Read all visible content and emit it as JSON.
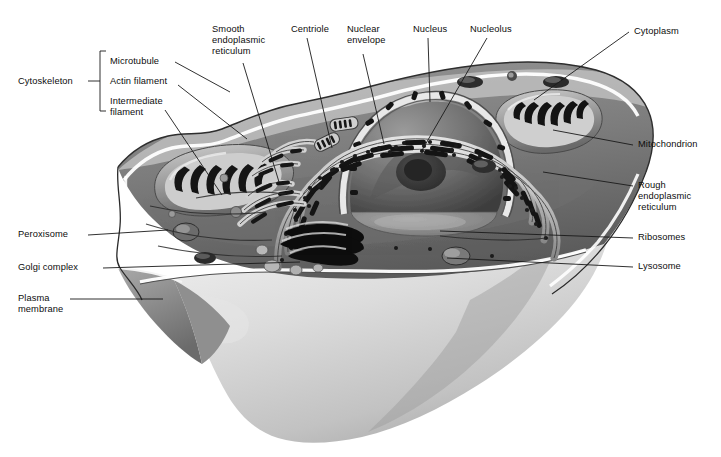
{
  "figure": {
    "style": "grayscale airbrush biological illustration",
    "colors": {
      "background": "#ffffff",
      "label_text": "#0d0d0d",
      "leader_line": "#1a1a1a",
      "cytoplasm_mid": "#8e8e8e",
      "cytoplasm_dark": "#4a4a4a",
      "organelle_dark": "#141414",
      "membrane_highlight": "#ffffff",
      "cell_surface_light": "#d8d8d8",
      "nucleus_fill": "#6e6e6e",
      "nucleolus": "#3a3a3a"
    }
  },
  "bracket": {
    "group_label": "Cytoskeleton",
    "items": [
      {
        "label": "Microtubule"
      },
      {
        "label": "Actin filament"
      },
      {
        "label": "Intermediate\nfilament"
      }
    ]
  },
  "labels": [
    {
      "id": "smooth-er",
      "text": "Smooth\nendoplasmic\nreticulum",
      "align": "left",
      "x": 212,
      "y": 24
    },
    {
      "id": "centriole",
      "text": "Centriole",
      "align": "left",
      "x": 291,
      "y": 24
    },
    {
      "id": "nuclear-envelope",
      "text": "Nuclear\nenvelope",
      "align": "left",
      "x": 347,
      "y": 24
    },
    {
      "id": "nucleus",
      "text": "Nucleus",
      "align": "left",
      "x": 413,
      "y": 24
    },
    {
      "id": "nucleolus",
      "text": "Nucleolus",
      "align": "left",
      "x": 470,
      "y": 24
    },
    {
      "id": "cytoplasm",
      "text": "Cytoplasm",
      "align": "left",
      "x": 634,
      "y": 29
    },
    {
      "id": "mitochondrion",
      "text": "Mitochondrion",
      "align": "left",
      "x": 638,
      "y": 141
    },
    {
      "id": "rough-er",
      "text": "Rough\nendoplasmic\nreticulum",
      "align": "left",
      "x": 638,
      "y": 181
    },
    {
      "id": "ribosomes",
      "text": "Ribosomes",
      "align": "left",
      "x": 638,
      "y": 234
    },
    {
      "id": "lysosome",
      "text": "Lysosome",
      "align": "left",
      "x": 638,
      "y": 263
    },
    {
      "id": "peroxisome",
      "text": "Peroxisome",
      "align": "left",
      "x": 18,
      "y": 231
    },
    {
      "id": "golgi-complex",
      "text": "Golgi complex",
      "align": "left",
      "x": 18,
      "y": 264
    },
    {
      "id": "plasma-membrane",
      "text": "Plasma\nmembrane",
      "align": "left",
      "x": 18,
      "y": 295
    }
  ],
  "leaders": [
    {
      "id": "leader-microtubule",
      "points": "175,62 230,92"
    },
    {
      "id": "leader-actin-filament",
      "points": "178,85 247,139"
    },
    {
      "id": "leader-intermediate",
      "points": "165,110 222,195"
    },
    {
      "id": "leader-smooth-er",
      "points": "243,63 279,182"
    },
    {
      "id": "leader-centriole",
      "points": "307,38 332,148"
    },
    {
      "id": "leader-nuclear-envelope",
      "points": "363,54 384,144"
    },
    {
      "id": "leader-nucleus",
      "points": "428,38 430,102"
    },
    {
      "id": "leader-nucleolus",
      "points": "487,38 421,152"
    },
    {
      "id": "leader-cytoplasm",
      "points": "629,32 534,100"
    },
    {
      "id": "leader-mitochondrion",
      "points": "633,145 553,130"
    },
    {
      "id": "leader-rough-er",
      "points": "633,186 543,172"
    },
    {
      "id": "leader-ribosomes",
      "points": "633,238 440,231"
    },
    {
      "id": "leader-lysosome",
      "points": "633,267 447,258"
    },
    {
      "id": "leader-peroxisome",
      "points": "88,235 168,230"
    },
    {
      "id": "leader-golgi-complex",
      "points": "103,268 300,262"
    },
    {
      "id": "leader-plasma-membrane",
      "points": "70,299 163,299"
    }
  ]
}
